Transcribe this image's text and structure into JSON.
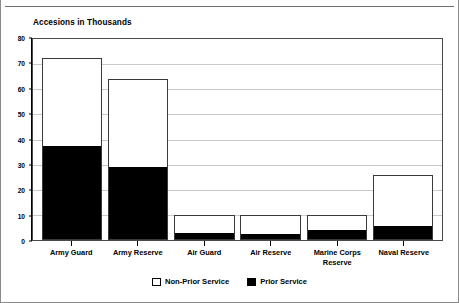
{
  "chart_data": {
    "type": "bar",
    "subtype": "stacked-vertical",
    "title": "Accesions in Thousands",
    "xlabel": "",
    "ylabel": "",
    "ylim": [
      0,
      80
    ],
    "ytick_step": 10,
    "yticks": [
      80,
      70,
      60,
      50,
      40,
      30,
      20,
      10,
      0
    ],
    "ytick_labels": [
      "80",
      "70",
      "60",
      "50",
      "40",
      "30",
      "20",
      "10",
      "0"
    ],
    "grid": true,
    "grid_axis": "y",
    "legend_position": "bottom-center",
    "categories": [
      "Army Guard",
      "Army Reserve",
      "Air Guard",
      "Air Reserve",
      "Marine Corps Reserve",
      "Naval Reserve"
    ],
    "category_lines": [
      [
        "Army Guard"
      ],
      [
        "Army Reserve"
      ],
      [
        "Air Guard"
      ],
      [
        "Air Reserve"
      ],
      [
        "Marine Corps",
        "Reserve"
      ],
      [
        "Naval Reserve"
      ]
    ],
    "series": [
      {
        "name": "Prior Service",
        "color": "#000000",
        "values": [
          37.5,
          29,
          2.5,
          2,
          4,
          5.5
        ]
      },
      {
        "name": "Non-Prior Service",
        "color": "#ffffff",
        "values": [
          35,
          35,
          7.5,
          8,
          6,
          20.5
        ]
      }
    ],
    "totals": [
      72.5,
      64,
      10,
      10,
      10,
      26
    ]
  },
  "legend": {
    "items": [
      {
        "label": "Non-Prior Service",
        "swatch": "open"
      },
      {
        "label": "Prior Service",
        "swatch": "filled"
      }
    ]
  },
  "colors": {
    "prior_service": "#000000",
    "non_prior_service": "#ffffff",
    "gridline": "#c9c9c9",
    "axis": "#4a4a4a",
    "frame": "#8a8a8a"
  }
}
